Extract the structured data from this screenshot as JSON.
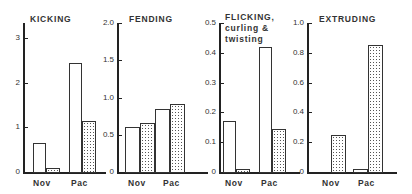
{
  "chart_data": [
    {
      "type": "bar",
      "title": "KICKING",
      "categories": [
        "Nov",
        "Pac"
      ],
      "series": [
        {
          "name": "open",
          "values": [
            0.65,
            2.45
          ]
        },
        {
          "name": "stippled",
          "values": [
            0.1,
            1.15
          ]
        }
      ],
      "yticks": [
        "0",
        "1",
        "2",
        "3"
      ],
      "ylim": [
        0,
        3.3
      ],
      "xlabel": "",
      "ylabel": ""
    },
    {
      "type": "bar",
      "title": "FENDING",
      "categories": [
        "Nov",
        "Pac"
      ],
      "series": [
        {
          "name": "open",
          "values": [
            0.6,
            0.85
          ]
        },
        {
          "name": "stippled",
          "values": [
            0.66,
            0.91
          ]
        }
      ],
      "yticks": [
        "0",
        "0.5",
        "1.0",
        "1.5",
        "2.0"
      ],
      "ylim": [
        0,
        2.0
      ],
      "xlabel": "",
      "ylabel": ""
    },
    {
      "type": "bar",
      "title": "FLICKING, curling & twisting",
      "title_lines": [
        "FLICKING,",
        "curling &",
        "twisting"
      ],
      "categories": [
        "Nov",
        "Pac"
      ],
      "series": [
        {
          "name": "open",
          "values": [
            0.17,
            0.42
          ]
        },
        {
          "name": "stippled",
          "values": [
            0.01,
            0.145
          ]
        }
      ],
      "yticks": [
        "0",
        "0.1",
        "0.2",
        "0.3",
        "0.4",
        "0.5"
      ],
      "ylim": [
        0,
        0.5
      ],
      "xlabel": "",
      "ylabel": ""
    },
    {
      "type": "bar",
      "title": "EXTRUDING",
      "categories": [
        "Nov",
        "Pac"
      ],
      "series": [
        {
          "name": "open",
          "values": [
            0,
            0.02
          ]
        },
        {
          "name": "stippled",
          "values": [
            0.25,
            0.85
          ]
        }
      ],
      "yticks": [
        "0",
        "0.2",
        "0.4",
        "0.6",
        "0.8",
        "1.0"
      ],
      "ylim": [
        0,
        1.0
      ],
      "xlabel": "",
      "ylabel": ""
    }
  ]
}
